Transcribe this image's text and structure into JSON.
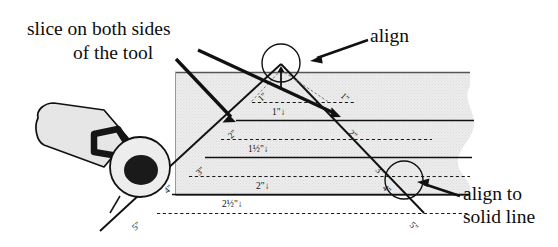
{
  "figure": {
    "type": "technique-diagram"
  },
  "callouts": {
    "slice_line1": "slice on both sides",
    "slice_line2": "of the tool",
    "align": "align",
    "align_solid_line1": "align to",
    "align_solid_line2": "solid line"
  },
  "tool": {
    "name": "rotary-cutter",
    "handle_color": "#e3e3e3",
    "bracket_color": "#151515",
    "blade_color": "#ededed",
    "hub_color": "#1a1a1a"
  },
  "panel": {
    "fill": "#eaeaea",
    "edge_style": "torn",
    "top_rule_color": "#555555"
  },
  "edge_labels_left": [
    "1\"",
    "2\"",
    "3\"",
    "4\"",
    "5\""
  ],
  "edge_labels_right": [
    "1\"",
    "2\"",
    "3\"",
    "4\"",
    "5\""
  ],
  "center_labels": [
    {
      "text": "1\"",
      "arrow": "↓"
    },
    {
      "text": "1½\"",
      "arrow": "↓"
    },
    {
      "text": "2\"",
      "arrow": "↓"
    },
    {
      "text": "2½\"",
      "arrow": "↓"
    }
  ],
  "apex_marker": {
    "arrow": "↑",
    "circled": true
  },
  "colors": {
    "line": "#111111",
    "dash": "#1a1a1a",
    "text": "#0d0d0d"
  }
}
